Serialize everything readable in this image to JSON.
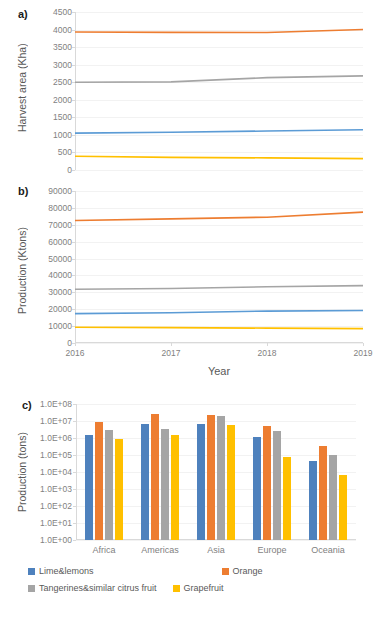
{
  "figure": {
    "panels": [
      {
        "letter": "a)"
      },
      {
        "letter": "b)"
      },
      {
        "letter": "c)"
      }
    ]
  },
  "chart_data": [
    {
      "type": "line",
      "panel": "a",
      "title": "",
      "xlabel": "",
      "ylabel": "Harvest area (Kha)",
      "x": [
        2016,
        2017,
        2018,
        2019
      ],
      "xticklabels": [
        "2016",
        "2017",
        "2018",
        "2019"
      ],
      "ylim": [
        0,
        4500
      ],
      "yticks": [
        0,
        500,
        1000,
        1500,
        2000,
        2500,
        3000,
        3500,
        4000,
        4500
      ],
      "yticklabels": [
        "0",
        "500",
        "1000",
        "1500",
        "2000",
        "2500",
        "3000",
        "3500",
        "4000",
        "4500"
      ],
      "grid": true,
      "legend": "none",
      "series": [
        {
          "name": "Orange",
          "color": "#ED7D31",
          "values": [
            3930,
            3920,
            3915,
            4000
          ]
        },
        {
          "name": "Tangerines&similar citrus fruit",
          "color": "#A5A5A5",
          "values": [
            2500,
            2510,
            2630,
            2680
          ]
        },
        {
          "name": "Lime&lemons",
          "color": "#5B9BD5",
          "values": [
            1050,
            1075,
            1110,
            1145
          ]
        },
        {
          "name": "Grapefruit",
          "color": "#FFC000",
          "values": [
            390,
            360,
            345,
            325
          ]
        }
      ]
    },
    {
      "type": "line",
      "panel": "b",
      "title": "",
      "xlabel": "Year",
      "ylabel": "Production (Ktons)",
      "x": [
        2016,
        2017,
        2018,
        2019
      ],
      "xticklabels": [
        "2016",
        "2017",
        "2018",
        "2019"
      ],
      "ylim": [
        0,
        90000
      ],
      "yticks": [
        0,
        10000,
        20000,
        30000,
        40000,
        50000,
        60000,
        70000,
        80000,
        90000
      ],
      "yticklabels": [
        "0",
        "10000",
        "20000",
        "30000",
        "40000",
        "50000",
        "60000",
        "70000",
        "80000",
        "90000"
      ],
      "grid": true,
      "legend": "none",
      "series": [
        {
          "name": "Orange",
          "color": "#ED7D31",
          "values": [
            72500,
            73500,
            74500,
            77500
          ]
        },
        {
          "name": "Tangerines&similar citrus fruit",
          "color": "#A5A5A5",
          "values": [
            31800,
            32300,
            33300,
            34000
          ]
        },
        {
          "name": "Lime&lemons",
          "color": "#5B9BD5",
          "values": [
            17400,
            17900,
            18900,
            19200
          ]
        },
        {
          "name": "Grapefruit",
          "color": "#FFC000",
          "values": [
            9300,
            9100,
            8800,
            8500
          ]
        }
      ]
    },
    {
      "type": "bar",
      "panel": "c",
      "title": "",
      "xlabel": "",
      "ylabel": "Production (tons)",
      "yscale": "log",
      "categories": [
        "Africa",
        "Americas",
        "Asia",
        "Europe",
        "Oceania"
      ],
      "ylim": [
        1,
        100000000
      ],
      "yticks": [
        1,
        10,
        100,
        1000,
        10000,
        100000,
        1000000,
        10000000,
        100000000
      ],
      "yticklabels": [
        "1.0E+00",
        "1.0E+01",
        "1.0E+02",
        "1.0E+03",
        "1.0E+04",
        "1.0E+05",
        "1.0E+06",
        "1.0E+07",
        "1.0E+08"
      ],
      "grid": true,
      "legend": "bottom",
      "series": [
        {
          "name": "Lime&lemons",
          "color": "#4E81BD",
          "values": [
            1600000,
            7000000,
            6500000,
            1200000,
            42000
          ]
        },
        {
          "name": "Orange",
          "color": "#ED7D31",
          "values": [
            8500000,
            27000000,
            24000000,
            5000000,
            330000
          ]
        },
        {
          "name": "Tangerines&similar citrus fruit",
          "color": "#A5A5A5",
          "values": [
            3000000,
            3600000,
            20000000,
            2600000,
            100000
          ]
        },
        {
          "name": "Grapefruit",
          "color": "#FFC000",
          "values": [
            850000,
            1500000,
            5500000,
            75000,
            6500
          ]
        }
      ]
    }
  ],
  "legend": {
    "items": [
      {
        "label": "Lime&lemons",
        "color": "#4E81BD"
      },
      {
        "label": "Orange",
        "color": "#ED7D31"
      },
      {
        "label": "Tangerines&similar citrus fruit",
        "color": "#A5A5A5"
      },
      {
        "label": "Grapefruit",
        "color": "#FFC000"
      }
    ]
  },
  "caption": {
    "text": ""
  }
}
